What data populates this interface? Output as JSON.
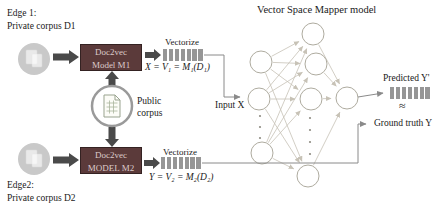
{
  "title": "Vector Space Mapper model",
  "edge1": {
    "line1": "Edge 1:",
    "line2": "Private corpus D1"
  },
  "edge2": {
    "line1": "Edge2:",
    "line2": "Private corpus D2"
  },
  "public_corpus_label": "Public corpus",
  "models": {
    "m1": {
      "line1": "Doc2vec",
      "line2": "Model M1"
    },
    "m2": {
      "line1": "Doc2vec",
      "line2": "MODEL M2"
    }
  },
  "vectorize_top": "Vectorize",
  "vectorize_bottom": "Vectorize",
  "formula_x": "X = V₁ = M₁(D₁)",
  "formula_y": "Y = V₂ = M₂(D₂)",
  "input_label": "Input X",
  "predicted_label": "Predicted Y'",
  "approx_symbol": "≈",
  "ground_truth_label": "Ground truth Y",
  "colors": {
    "ink": "#1a1a1a",
    "maroon": "#5b3a3a",
    "box_text": "#dccaca",
    "arrow_dark": "#4a4a4a",
    "bar": "#969696",
    "wire": "#8a8a8a",
    "net_line": "#c7c2b6",
    "node_stroke": "#aeab9f",
    "circle_gray": "#c9c9c9",
    "public_ring": "#9a9a9a"
  },
  "network": {
    "input_layer_visible_nodes": 3,
    "hidden_layer_visible_nodes": 4,
    "output_nodes": 1
  }
}
